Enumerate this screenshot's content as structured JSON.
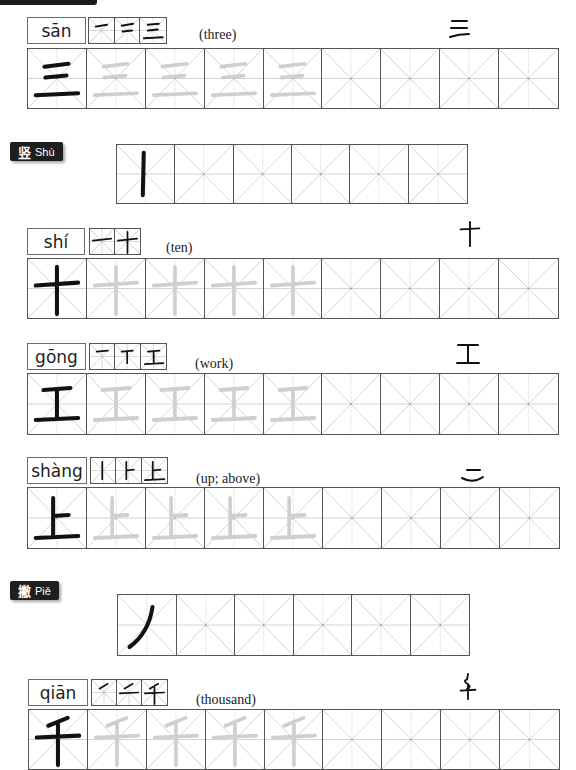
{
  "page": {
    "background": "#ffffff",
    "grid_line_color": "#555555",
    "guide_color": "#b5b5b5",
    "trace_color": "#cfcfcf",
    "ink_color": "#111111"
  },
  "entries": [
    {
      "pinyin": "sān",
      "gloss": "(three)",
      "character": "三",
      "ancient_form": "三",
      "stroke_steps": 3,
      "trace_count": 4,
      "total_cells": 9
    },
    {
      "pinyin": "shí",
      "gloss": "(ten)",
      "character": "十",
      "ancient_form": "十",
      "stroke_steps": 2,
      "trace_count": 4,
      "total_cells": 9
    },
    {
      "pinyin": "gōng",
      "gloss": "(work)",
      "character": "工",
      "ancient_form": "工",
      "stroke_steps": 3,
      "trace_count": 4,
      "total_cells": 9
    },
    {
      "pinyin": "shàng",
      "gloss": "(up; above)",
      "character": "上",
      "ancient_form": "二",
      "stroke_steps": 3,
      "trace_count": 4,
      "total_cells": 9
    },
    {
      "pinyin": "qiān",
      "gloss": "(thousand)",
      "character": "千",
      "ancient_form": "千",
      "stroke_steps": 3,
      "trace_count": 4,
      "total_cells": 9
    }
  ],
  "strokes": [
    {
      "hanzi": "竖",
      "pinyin": "Shù",
      "cells": 6
    },
    {
      "hanzi": "撇",
      "pinyin": "Piě",
      "cells": 6
    }
  ]
}
